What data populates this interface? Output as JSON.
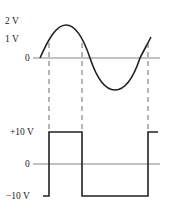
{
  "diagram": {
    "type": "waveform-comparator",
    "colors": {
      "stroke": "#222222",
      "axis": "#666666",
      "dash": "#444444",
      "background": "#ffffff"
    },
    "top_plot": {
      "description": "Sine input signal",
      "y_labels": [
        "2 V",
        "1 V",
        "0"
      ],
      "threshold_crossings_x": [
        49,
        82,
        148
      ]
    },
    "bottom_plot": {
      "description": "Square output signal",
      "y_labels": [
        "+10 V",
        "0",
        "−10 V"
      ]
    }
  }
}
